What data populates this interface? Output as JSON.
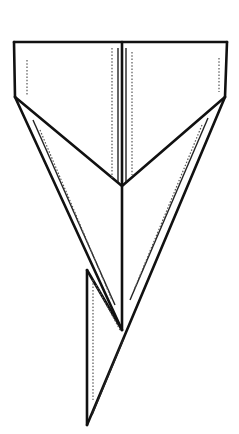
{
  "diagram": {
    "stroke_color": "#111111",
    "shade_color": "#555555",
    "background": "#ffffff"
  }
}
